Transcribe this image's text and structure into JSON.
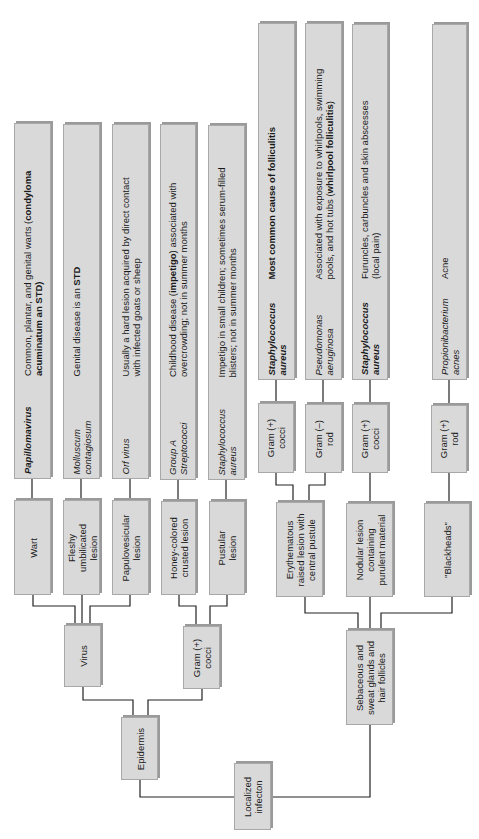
{
  "diagram": {
    "root": {
      "label": "Localized\ninfecton"
    },
    "branches": [
      {
        "site": "Epidermis",
        "groups": [
          {
            "category": "Virus",
            "items": [
              {
                "lesion": "Wart",
                "organism": "Papillomavirus",
                "organism_style": "bold-italic",
                "note_plain": "Common, plantar, and genital warts (",
                "note_bold": "condyloma acuminatum an STD",
                "note_end": ")"
              },
              {
                "lesion": "Fleshy umbilicated lesion",
                "organism": "Molluscum contagiosum",
                "organism_style": "italic",
                "note_plain": "Genital disease is an ",
                "note_bold": "STD",
                "note_end": ""
              },
              {
                "lesion": "Papulovesicular lesion",
                "organism": "Orf virus",
                "organism_style": "italic",
                "note_plain": "Usually a hard lesion acquired by direct contact with infected goats or sheep",
                "note_bold": "",
                "note_end": ""
              }
            ]
          },
          {
            "category": "Gram (+) cocci",
            "items": [
              {
                "lesion": "Honey-colored crusted lesion",
                "organism": "Group A Streptococci",
                "organism_style": "italic",
                "note_plain": "Childhood disease (",
                "note_bold": "impetigo",
                "note_end": ") associated with overcrowding; not in summer months"
              },
              {
                "lesion": "Pustular lesion",
                "organism": "Staphylococcus aureus",
                "organism_style": "italic",
                "note_plain": "Impetigo in small children; sometimes serum-filled blisters; not in summer months",
                "note_bold": "",
                "note_end": ""
              }
            ]
          }
        ]
      },
      {
        "site": "Sebaceous and sweat glands and hair follicles",
        "groups": [
          {
            "lesion": "Erythematous raised lesion with central pustule",
            "items": [
              {
                "gram": "Gram (+) cocci",
                "organism": "Staphylococcus aureus",
                "organism_style": "bold-italic",
                "note_plain": "",
                "note_bold": "Most common cause of folliculitis",
                "note_end": ""
              },
              {
                "gram": "Gram (–) rod",
                "organism": "Pseudomonas aeruginosa",
                "organism_style": "italic",
                "note_plain": "Associated with exposure to whirlpools, swimming pools, and hot tubs (",
                "note_bold": "whirlpool folliculitis",
                "note_end": ")"
              }
            ]
          },
          {
            "lesion": "Nodular lesion containing purulent material",
            "items": [
              {
                "gram": "Gram (+) cocci",
                "organism": "Staphylococcus aureus",
                "organism_style": "bold-italic",
                "note_plain": "Furuncles, carbuncles and skin abscesses (local pain)",
                "note_bold": "",
                "note_end": ""
              }
            ]
          },
          {
            "lesion": "\"Blackheads\"",
            "items": [
              {
                "gram": "Gram (+) rod",
                "organism": "Propionibacterium acnes",
                "organism_style": "italic",
                "note_plain": "Acne",
                "note_bold": "",
                "note_end": ""
              }
            ]
          }
        ]
      }
    ],
    "text": {
      "root_l1": "Localized",
      "root_l2": "infecton",
      "epidermis": "Epidermis",
      "virus": "Virus",
      "gpc_left_l1": "Gram (+)",
      "gpc_left_l2": "cocci",
      "sebaceous_l1": "Sebaceous and",
      "sebaceous_l2": "sweat glands and",
      "sebaceous_l3": "hair follicles",
      "wart": "Wart",
      "fleshy_l1": "Fleshy",
      "fleshy_l2": "umbilicated",
      "fleshy_l3": "lesion",
      "papulo_l1": "Papulovesicular",
      "papulo_l2": "lesion",
      "honey_l1": "Honey-colored",
      "honey_l2": "crusted lesion",
      "pustular_l1": "Pustular",
      "pustular_l2": "lesion",
      "papilloma": "Papillomavirus",
      "papilloma_note_l1a": "Common, plantar, and genital warts (",
      "papilloma_note_l1b": "condyloma",
      "papilloma_note_l2": "acuminatum an STD)",
      "molluscum_l1": "Molluscum",
      "molluscum_l2": "contagiosum",
      "molluscum_note_a": "Genital disease is an ",
      "molluscum_note_b": "STD",
      "orf": "Orf virus",
      "orf_note_l1": "Usually a hard lesion acquired by direct contact",
      "orf_note_l2": "with infected goats or sheep",
      "strep_l1": "Group A",
      "strep_l2": "Streptococci",
      "strep_note_l1a": "Childhood disease (",
      "strep_note_l1b": "impetigo",
      "strep_note_l1c": ") associated with",
      "strep_note_l2": "overcrowding; not in summer months",
      "staph1_l1": "Staphylococcus",
      "staph1_l2": "aureus",
      "staph1_note_l1": "Impetigo in small children; sometimes serum-filled",
      "staph1_note_l2": "blisters; not in summer months",
      "eryth_l1": "Erythematous",
      "eryth_l2": "raised lesion with",
      "eryth_l3": "central pustule",
      "nodular_l1": "Nodular lesion",
      "nodular_l2": "containing",
      "nodular_l3": "purulent material",
      "blackheads": "\"Blackheads\"",
      "g1_l1": "Gram (+)",
      "g1_l2": "cocci",
      "g2_l1": "Gram (–)",
      "g2_l2": "rod",
      "g3_l1": "Gram (+)",
      "g3_l2": "cocci",
      "g4_l1": "Gram (+)",
      "g4_l2": "rod",
      "staph2_l1": "Staphylococcus",
      "staph2_l2": "aureus",
      "staph2_note": "Most common cause of folliculitis",
      "pseudo_l1": "Pseudomonas",
      "pseudo_l2": "aeruginosa",
      "pseudo_note_l1": "Associated with exposure to whirlpools, swimming",
      "pseudo_note_l2a": "pools, and hot tubs (",
      "pseudo_note_l2b": "whirlpool folliculitis",
      "pseudo_note_l2c": ")",
      "staph3_l1": "Staphylococcus",
      "staph3_l2": "aureus",
      "staph3_note_l1": "Furuncles, carbuncles and skin abscesses",
      "staph3_note_l2": "(local pain)",
      "propioni_l1": "Propionibacterium",
      "propioni_l2": "acnes",
      "propioni_note": "Acne"
    },
    "colors": {
      "box_fill": "#d9d9d9",
      "box_border": "#a8a8a8",
      "line": "#222222"
    }
  }
}
